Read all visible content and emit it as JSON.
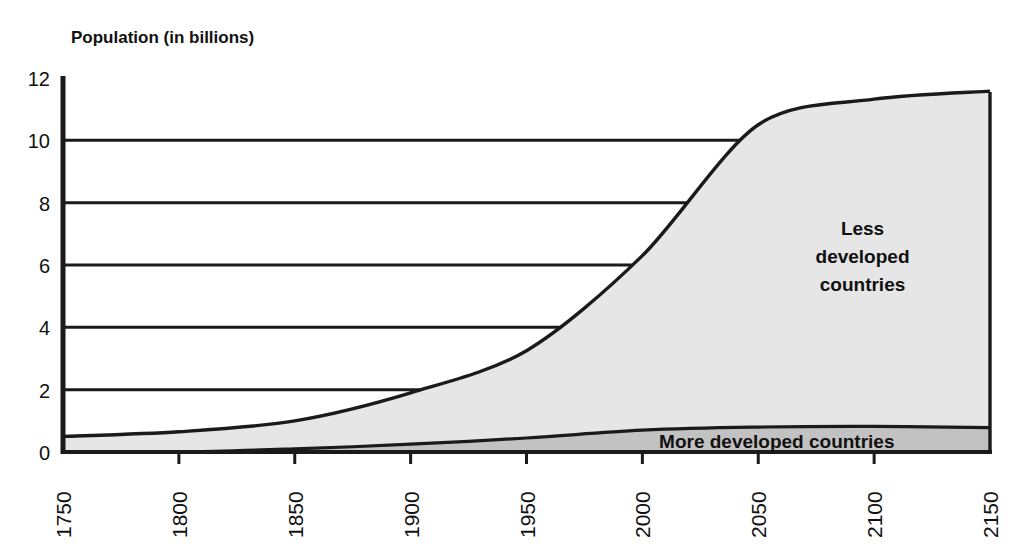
{
  "chart_data": {
    "type": "area",
    "title": "Population (in billions)",
    "xlabel": "",
    "ylabel": "Population (in billions)",
    "stacked": true,
    "grid": true,
    "grid_axis": "y",
    "legend_position": "inline-annotation",
    "xlim": [
      1750,
      2150
    ],
    "ylim": [
      0,
      12
    ],
    "y_ticks": [
      0,
      2,
      4,
      6,
      8,
      10,
      12
    ],
    "y_tick_labels": [
      "0",
      "2",
      "4",
      "6",
      "8",
      "10",
      "12"
    ],
    "gridline_values": [
      2,
      4,
      6,
      8,
      10
    ],
    "x_ticks": [
      1750,
      1800,
      1850,
      1900,
      1950,
      2000,
      2050,
      2100,
      2150
    ],
    "x_tick_labels": [
      "1750",
      "1800",
      "1850",
      "1900",
      "1950",
      "2000",
      "2050",
      "2100",
      "2150"
    ],
    "x_tick_label_rotation": -90,
    "x": [
      1750,
      1800,
      1850,
      1900,
      1950,
      2000,
      2050,
      2100,
      2150
    ],
    "series": [
      {
        "name": "More developed countries",
        "label": "More developed countries",
        "values": [
          0.0,
          0.0,
          0.1,
          0.25,
          0.45,
          0.7,
          0.8,
          0.82,
          0.78
        ],
        "fill_color": "#c2c2c2",
        "line_color": "#1a1a1a"
      },
      {
        "name": "Less developed countries",
        "label": "Less developed countries",
        "values": [
          0.5,
          0.65,
          0.9,
          1.65,
          2.8,
          5.6,
          9.7,
          10.5,
          10.8
        ],
        "fill_color": "#e6e6e6",
        "line_color": "#1a1a1a"
      }
    ],
    "totals": [
      0.5,
      0.65,
      1.0,
      1.9,
      3.25,
      6.3,
      10.5,
      11.32,
      11.58
    ],
    "annotations": [
      {
        "id": "less-developed-label",
        "text_lines": [
          "Less",
          "developed",
          "countries"
        ],
        "x": 2095,
        "y": 6.3
      },
      {
        "id": "more-developed-label",
        "text_lines": [
          "More developed countries"
        ],
        "x": 2058,
        "y": 0.35
      }
    ],
    "colors": {
      "axis": "#1a1a1a",
      "gridline": "#1a1a1a",
      "background": "#ffffff",
      "less_developed_fill": "#e6e6e6",
      "more_developed_fill": "#c2c2c2",
      "text": "#111111"
    }
  }
}
